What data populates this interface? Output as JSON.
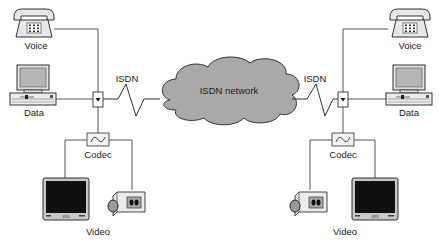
{
  "diagram": {
    "type": "network-topology",
    "cloud": {
      "label": "ISDN network",
      "fill": "#a9a9a9",
      "stroke": "#333333"
    },
    "links": [
      {
        "label": "ISDN",
        "side": "left"
      },
      {
        "label": "ISDN",
        "side": "right"
      }
    ],
    "left_site": {
      "voice": {
        "label": "Voice"
      },
      "data": {
        "label": "Data"
      },
      "codec": {
        "label": "Codec"
      },
      "video": {
        "label": "Video"
      }
    },
    "right_site": {
      "voice": {
        "label": "Voice"
      },
      "data": {
        "label": "Data"
      },
      "codec": {
        "label": "Codec"
      },
      "video": {
        "label": "Video"
      }
    },
    "colors": {
      "line": "#444444",
      "device_fill": "#e6e6e6",
      "screen_gray": "#b8b8b8",
      "monitor_black": "#111111"
    }
  }
}
